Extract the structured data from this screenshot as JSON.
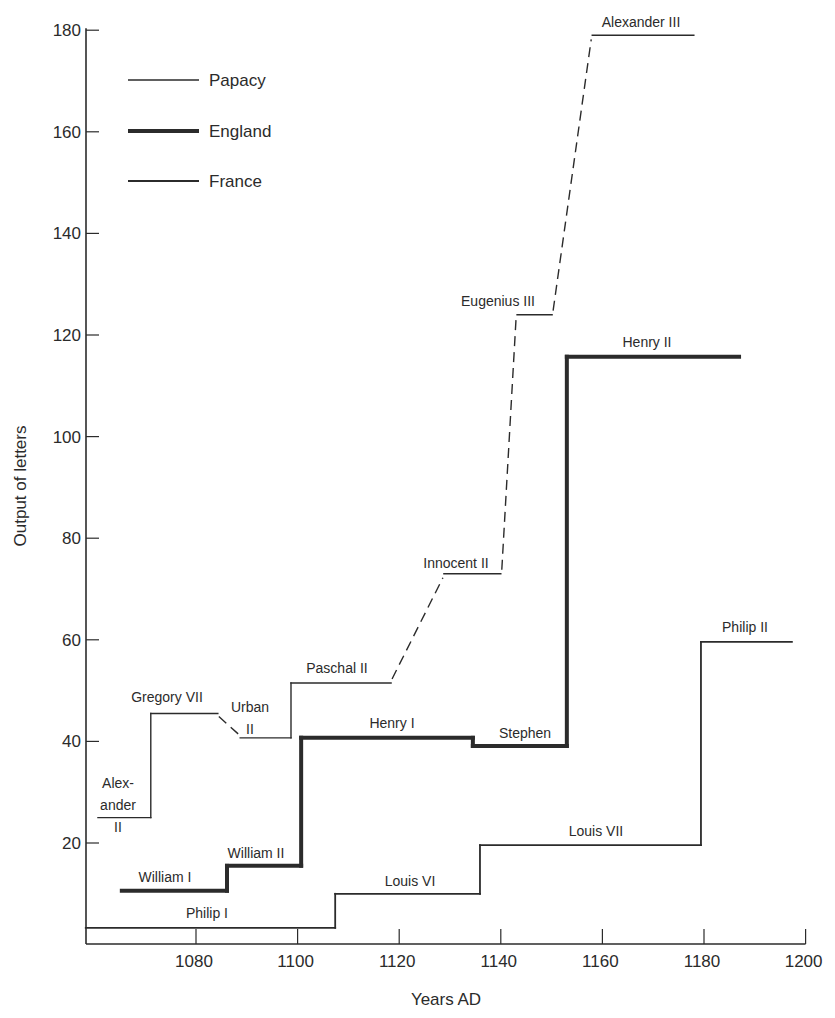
{
  "chart_data": {
    "type": "line",
    "subtype": "step",
    "title": "",
    "xlabel": "Years AD",
    "ylabel": "Output of letters",
    "xlim": [
      1058.3,
      1200
    ],
    "ylim": [
      0,
      180
    ],
    "x_ticks": [
      1080,
      1100,
      1120,
      1140,
      1160,
      1180,
      1200
    ],
    "y_ticks": [
      20,
      40,
      60,
      80,
      100,
      120,
      140,
      160,
      180
    ],
    "grid": false,
    "legend": {
      "position": "upper-left",
      "entries": [
        {
          "name": "Papacy",
          "style": "thin"
        },
        {
          "name": "England",
          "style": "thick"
        },
        {
          "name": "France",
          "style": "medium"
        }
      ]
    },
    "series": [
      {
        "name": "Papacy",
        "style": "thin, dashed transitions",
        "segments": [
          {
            "label": "Alexander II",
            "start": 1060.7,
            "end": 1071.1,
            "value": 25
          },
          {
            "label": "Gregory VII",
            "start": 1071.1,
            "end": 1084.3,
            "value": 45.5
          },
          {
            "label": "Urban II",
            "start": 1088.7,
            "end": 1098.7,
            "value": 40.7
          },
          {
            "label": "Paschal II",
            "start": 1098.7,
            "end": 1118.4,
            "value": 51.5
          },
          {
            "label": "Innocent II",
            "start": 1128.8,
            "end": 1140,
            "value": 73
          },
          {
            "label": "Eugenius III",
            "start": 1143.2,
            "end": 1150.1,
            "value": 124
          },
          {
            "label": "Alexander III",
            "start": 1158,
            "end": 1178,
            "value": 179
          }
        ]
      },
      {
        "name": "England",
        "style": "thick",
        "segments": [
          {
            "label": "William I",
            "start": 1065.4,
            "end": 1086.1,
            "value": 10.6
          },
          {
            "label": "William II",
            "start": 1086.1,
            "end": 1100.7,
            "value": 15.5
          },
          {
            "label": "Henry I",
            "start": 1100.7,
            "end": 1134.5,
            "value": 40.7
          },
          {
            "label": "Stephen",
            "start": 1134.5,
            "end": 1153,
            "value": 39.1
          },
          {
            "label": "Henry II",
            "start": 1153,
            "end": 1186.9,
            "value": 115.7
          }
        ]
      },
      {
        "name": "France",
        "style": "medium",
        "segments": [
          {
            "label": "Philip I",
            "start": 1058.3,
            "end": 1107.4,
            "value": 3.3
          },
          {
            "label": "Louis VI",
            "start": 1107.4,
            "end": 1135.9,
            "value": 10
          },
          {
            "label": "Louis VII",
            "start": 1135.9,
            "end": 1179.4,
            "value": 19.6
          },
          {
            "label": "Philip II",
            "start": 1179.4,
            "end": 1197.3,
            "value": 59.6
          }
        ]
      }
    ],
    "labels": [
      {
        "text": "Alex-",
        "series": "Papacy",
        "x": 118,
        "y": 788
      },
      {
        "text": "ander",
        "series": "Papacy",
        "x": 118,
        "y": 810
      },
      {
        "text": "II",
        "series": "Papacy",
        "x": 118,
        "y": 832
      },
      {
        "text": "Gregory VII",
        "series": "Papacy",
        "x": 167,
        "y": 702
      },
      {
        "text": "Urban",
        "series": "Papacy",
        "x": 250,
        "y": 712
      },
      {
        "text": "II",
        "series": "Papacy",
        "x": 250,
        "y": 734
      },
      {
        "text": "Paschal II",
        "series": "Papacy",
        "x": 337,
        "y": 673
      },
      {
        "text": "Innocent II",
        "series": "Papacy",
        "x": 456,
        "y": 568
      },
      {
        "text": "Eugenius III",
        "series": "Papacy",
        "x": 498,
        "y": 306
      },
      {
        "text": "Alexander III",
        "series": "Papacy",
        "x": 641,
        "y": 27
      },
      {
        "text": "William I",
        "series": "England",
        "x": 165,
        "y": 882
      },
      {
        "text": "William II",
        "series": "England",
        "x": 256,
        "y": 858
      },
      {
        "text": "Henry I",
        "series": "England",
        "x": 392,
        "y": 728
      },
      {
        "text": "Stephen",
        "series": "England",
        "x": 525,
        "y": 738
      },
      {
        "text": "Henry II",
        "series": "England",
        "x": 647,
        "y": 347
      },
      {
        "text": "Philip I",
        "series": "France",
        "x": 207,
        "y": 918
      },
      {
        "text": "Louis VI",
        "series": "France",
        "x": 410,
        "y": 886
      },
      {
        "text": "Louis VII",
        "series": "France",
        "x": 596,
        "y": 836
      },
      {
        "text": "Philip II",
        "series": "France",
        "x": 745,
        "y": 632
      }
    ]
  },
  "axes": {
    "x_title": "Years AD",
    "y_title": "Output of letters"
  },
  "colors": {
    "ink": "#2b2b2b",
    "background": "#ffffff"
  }
}
